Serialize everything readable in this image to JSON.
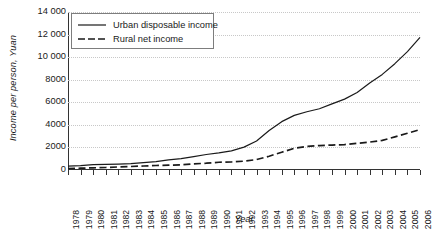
{
  "chart_data": {
    "type": "line",
    "title": "",
    "xlabel": "Year",
    "ylabel": "Income per person, Yuan",
    "ylim": [
      0,
      14000
    ],
    "ytick_labels": [
      "14 000",
      "12 000",
      "10 000",
      "8000",
      "6000",
      "4000",
      "2000",
      "0"
    ],
    "ytick_values": [
      14000,
      12000,
      10000,
      8000,
      6000,
      4000,
      2000,
      0
    ],
    "grid": "horizontal-dotted",
    "legend_position": "top-left",
    "x": [
      1978,
      1979,
      1980,
      1981,
      1982,
      1983,
      1984,
      1985,
      1986,
      1987,
      1988,
      1989,
      1990,
      1991,
      1992,
      1993,
      1994,
      1995,
      1996,
      1997,
      1998,
      1999,
      2000,
      2001,
      2002,
      2003,
      2004,
      2005,
      2006
    ],
    "categories": [
      "1978",
      "1979",
      "1980",
      "1981",
      "1982",
      "1983",
      "1984",
      "1985",
      "1986",
      "1987",
      "1988",
      "1989",
      "1990",
      "1991",
      "1992",
      "1993",
      "1994",
      "1995",
      "1996",
      "1997",
      "1998",
      "1999",
      "2000",
      "2001",
      "2002",
      "2003",
      "2004",
      "2005",
      "2006"
    ],
    "series": [
      {
        "name": "Urban disposable income",
        "style": "solid",
        "color": "#1a1a1a",
        "values": [
          343,
          387,
          478,
          492,
          527,
          565,
          652,
          739,
          900,
          1002,
          1181,
          1374,
          1510,
          1701,
          2027,
          2577,
          3496,
          4283,
          4839,
          5160,
          5425,
          5854,
          6280,
          6860,
          7703,
          8472,
          9422,
          10493,
          11759
        ]
      },
      {
        "name": "Rural net income",
        "style": "dashed",
        "color": "#1a1a1a",
        "values": [
          134,
          160,
          191,
          223,
          270,
          310,
          355,
          398,
          424,
          463,
          545,
          602,
          686,
          709,
          784,
          922,
          1221,
          1578,
          1926,
          2090,
          2162,
          2210,
          2253,
          2366,
          2476,
          2622,
          2936,
          3255,
          3587
        ]
      }
    ]
  },
  "legend": {
    "items": [
      {
        "label": "Urban disposable income",
        "style": "solid"
      },
      {
        "label": "Rural net income",
        "style": "dashed"
      }
    ]
  }
}
